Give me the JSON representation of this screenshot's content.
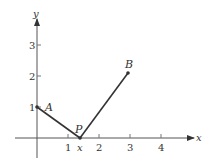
{
  "diagram": {
    "axes": {
      "x_label": "x",
      "y_label": "y",
      "x_ticks": [
        "1",
        "2",
        "3",
        "4"
      ],
      "y_ticks": [
        "1",
        "2",
        "3"
      ]
    },
    "points": {
      "A": {
        "label": "A",
        "coords": [
          0,
          1
        ]
      },
      "P": {
        "label": "P",
        "sublabel": "x",
        "coords": [
          1.5,
          0
        ]
      },
      "B": {
        "label": "B",
        "coords": [
          3,
          2
        ]
      }
    },
    "segments": [
      [
        "A",
        "P"
      ],
      [
        "P",
        "B"
      ]
    ],
    "colors": {
      "stroke": "#333333"
    }
  }
}
